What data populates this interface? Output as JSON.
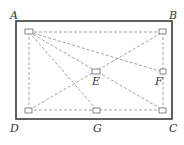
{
  "diagram": {
    "type": "geometry-rectangle",
    "colors": {
      "frame": "#3a3a3a",
      "dashed": "#8a8a8a",
      "marker": "#6a6a6a",
      "background": "#ffffff"
    },
    "labels": {
      "A": "A",
      "B": "B",
      "C": "C",
      "D": "D",
      "E": "E",
      "F": "F",
      "G": "G"
    }
  }
}
